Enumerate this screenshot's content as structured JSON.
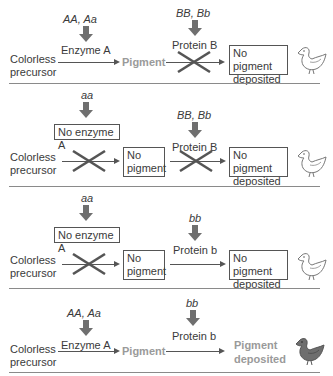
{
  "figure": {
    "title_partial": "",
    "colors": {
      "text": "#3a3a3a",
      "pigment_gray": "#9a9a9a",
      "arrow_gray": "#6f6f6f",
      "chick_pigmented": "#6e6e6e"
    },
    "panels": [
      {
        "gene_a": "AA, Aa",
        "enzyme_label": "Enzyme A",
        "enzyme_boxed": false,
        "gene_b": "BB, Bb",
        "protein_label": "Protein B",
        "start": [
          "Colorless",
          "precursor"
        ],
        "intermediate": "Pigment",
        "intermediate_boxed": false,
        "step1_blocked": false,
        "step2_blocked": true,
        "result": [
          "No pigment",
          "deposited"
        ],
        "result_boxed": true,
        "chick": "white-chick-icon"
      },
      {
        "gene_a": "aa",
        "enzyme_label": "No enzyme A",
        "enzyme_boxed": true,
        "gene_b": "BB, Bb",
        "protein_label": "Protein B",
        "start": [
          "Colorless",
          "precursor"
        ],
        "intermediate": [
          "No",
          "pigment"
        ],
        "intermediate_boxed": true,
        "step1_blocked": true,
        "step2_blocked": true,
        "result": [
          "No pigment",
          "deposited"
        ],
        "result_boxed": true,
        "chick": "white-chick-icon"
      },
      {
        "gene_a": "aa",
        "enzyme_label": "No enzyme A",
        "enzyme_boxed": true,
        "gene_b": "bb",
        "protein_label": "Protein b",
        "start": [
          "Colorless",
          "precursor"
        ],
        "intermediate": [
          "No",
          "pigment"
        ],
        "intermediate_boxed": true,
        "step1_blocked": true,
        "step2_blocked": false,
        "result": [
          "No pigment",
          "deposited"
        ],
        "result_boxed": true,
        "chick": "white-chick-icon"
      },
      {
        "gene_a": "AA, Aa",
        "enzyme_label": "Enzyme A",
        "enzyme_boxed": false,
        "gene_b": "bb",
        "protein_label": "Protein b",
        "start": [
          "Colorless",
          "precursor"
        ],
        "intermediate": "Pigment",
        "intermediate_boxed": false,
        "step1_blocked": false,
        "step2_blocked": false,
        "result": [
          "Pigment",
          "deposited"
        ],
        "result_boxed": false,
        "chick": "pigmented-chick-icon"
      }
    ]
  }
}
